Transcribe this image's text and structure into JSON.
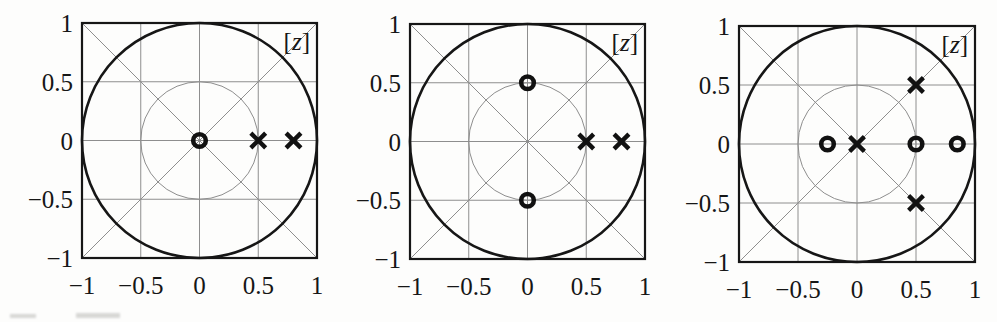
{
  "figure": {
    "background": "#fdfdfc",
    "axis_color": "#161616",
    "grid_color": "#8e8e8e",
    "marker_color": "#111111",
    "plane_label": "[z]"
  },
  "chart_data": [
    {
      "type": "scatter",
      "subtype": "pole-zero-z-plane",
      "title": "[z]",
      "xlim": [
        -1,
        1
      ],
      "ylim": [
        -1,
        1
      ],
      "xticks": [
        -1,
        -0.5,
        0,
        0.5,
        1
      ],
      "yticks": [
        -1,
        -0.5,
        0,
        0.5,
        1
      ],
      "xtick_labels": [
        "−1",
        "−0.5",
        "0",
        "0.5",
        "1"
      ],
      "ytick_labels": [
        "−1",
        "−0.5",
        "0",
        "0.5",
        "1"
      ],
      "grid": true,
      "diagonals": true,
      "unit_circle": true,
      "half_radius_circle": true,
      "zeros": [
        [
          0,
          0
        ]
      ],
      "poles": [
        [
          0.5,
          0
        ],
        [
          0.8,
          0
        ]
      ]
    },
    {
      "type": "scatter",
      "subtype": "pole-zero-z-plane",
      "title": "[z]",
      "xlim": [
        -1,
        1
      ],
      "ylim": [
        -1,
        1
      ],
      "xticks": [
        -1,
        -0.5,
        0,
        0.5,
        1
      ],
      "yticks": [
        -1,
        -0.5,
        0,
        0.5,
        1
      ],
      "xtick_labels": [
        "−1",
        "−0.5",
        "0",
        "0.5",
        "1"
      ],
      "ytick_labels": [
        "−1",
        "−0.5",
        "0",
        "0.5",
        "1"
      ],
      "grid": true,
      "diagonals": true,
      "unit_circle": true,
      "half_radius_circle": true,
      "zeros": [
        [
          0,
          0.5
        ],
        [
          0,
          -0.5
        ]
      ],
      "poles": [
        [
          0.5,
          0
        ],
        [
          0.8,
          0
        ]
      ]
    },
    {
      "type": "scatter",
      "subtype": "pole-zero-z-plane",
      "title": "[z]",
      "xlim": [
        -1,
        1
      ],
      "ylim": [
        -1,
        1
      ],
      "xticks": [
        -1,
        -0.5,
        0,
        0.5,
        1
      ],
      "yticks": [
        -1,
        -0.5,
        0,
        0.5,
        1
      ],
      "xtick_labels": [
        "−1",
        "−0.5",
        "0",
        "0.5",
        "1"
      ],
      "ytick_labels": [
        "−1",
        "−0.5",
        "0",
        "0.5",
        "1"
      ],
      "grid": true,
      "diagonals": true,
      "unit_circle": true,
      "half_radius_circle": true,
      "zeros": [
        [
          -0.25,
          0
        ],
        [
          0.5,
          0
        ],
        [
          0.85,
          0
        ]
      ],
      "poles": [
        [
          0,
          0
        ],
        [
          0.5,
          0.5
        ],
        [
          0.5,
          -0.5
        ]
      ]
    }
  ]
}
